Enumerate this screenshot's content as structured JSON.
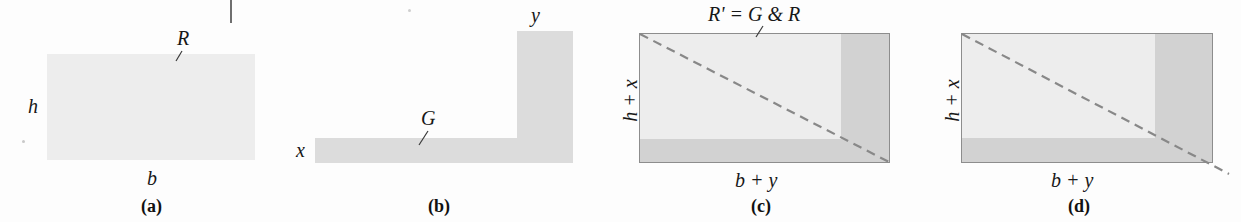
{
  "figure": {
    "background": "#ffffff",
    "colors": {
      "fill_light": "#ededed",
      "fill_mid": "#dcdcdc",
      "fill_dark": "#d2d2d2",
      "border": "#8d8d8d",
      "dashed_line": "#888888",
      "text": "#171717"
    }
  },
  "panels": [
    {
      "id": "a",
      "caption": "(a)",
      "labels": {
        "region": "R",
        "height": "h",
        "width": "b"
      }
    },
    {
      "id": "b",
      "caption": "(b)",
      "labels": {
        "region": "G",
        "strip_height": "x",
        "column_width": "y"
      }
    },
    {
      "id": "c",
      "caption": "(c)",
      "labels": {
        "region": "R' = G & R",
        "height": "h + x",
        "width": "b + y"
      }
    },
    {
      "id": "d",
      "caption": "(d)",
      "labels": {
        "height": "h + x",
        "width": "b + y"
      }
    }
  ]
}
